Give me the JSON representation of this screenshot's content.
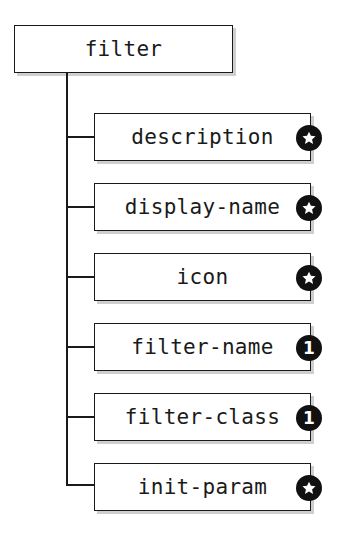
{
  "diagram": {
    "type": "tree",
    "root": {
      "label": "filter"
    },
    "children": [
      {
        "label": "description",
        "cardinality": "star",
        "badge_text": ""
      },
      {
        "label": "display-name",
        "cardinality": "star",
        "badge_text": ""
      },
      {
        "label": "icon",
        "cardinality": "star",
        "badge_text": ""
      },
      {
        "label": "filter-name",
        "cardinality": "one",
        "badge_text": "1"
      },
      {
        "label": "filter-class",
        "cardinality": "one",
        "badge_text": "1"
      },
      {
        "label": "init-param",
        "cardinality": "star",
        "badge_text": ""
      }
    ],
    "colors": {
      "line": "#1a1a1a",
      "badge_bg": "#111111",
      "badge_fg": "#ffffff",
      "shadow": "#cfcfcf"
    }
  }
}
